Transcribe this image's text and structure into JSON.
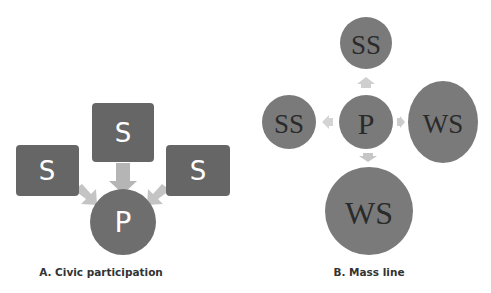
{
  "colors": {
    "node_fill": "#6b6b6b",
    "circle_fill": "#7a7a7a",
    "arrow_fill": "#bdbdbd",
    "arrow_fill_light": "#d6d6d6",
    "box_text": "#ffffff",
    "circle_text": "#2a2a2a",
    "caption_text": "#333333"
  },
  "diagram_a": {
    "caption": "A. Civic participation",
    "nodes": {
      "top": "S",
      "left": "S",
      "right": "S",
      "center": "P"
    },
    "edges": [
      {
        "from": "top",
        "to": "center"
      },
      {
        "from": "left",
        "to": "center"
      },
      {
        "from": "right",
        "to": "center"
      }
    ]
  },
  "diagram_b": {
    "caption": "B. Mass line",
    "nodes": {
      "center": "P",
      "top": "SS",
      "left": "SS",
      "right": "WS",
      "bottom": "WS"
    },
    "edges": [
      {
        "from": "center",
        "to": "top"
      },
      {
        "from": "center",
        "to": "left"
      },
      {
        "from": "center",
        "to": "right"
      },
      {
        "from": "center",
        "to": "bottom"
      }
    ]
  }
}
